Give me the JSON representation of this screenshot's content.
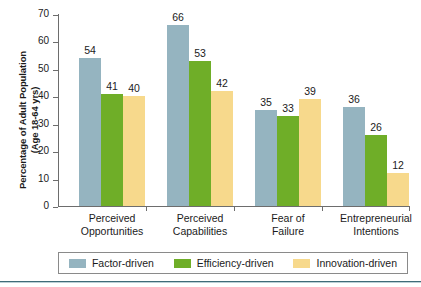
{
  "chart_data": {
    "type": "bar",
    "title": "",
    "subtitle": "",
    "xlabel": "",
    "ylabel": "Percentage of Adult Population (Age 18-64 yrs)",
    "ylabel_line1": "Percentage of Adult Population",
    "ylabel_line2": "(Age 18-64 yrs)",
    "ylim": [
      0,
      70
    ],
    "ytick_step": 10,
    "yticks": [
      0,
      10,
      20,
      30,
      40,
      50,
      60,
      70
    ],
    "ytick_labels": [
      "0",
      "10",
      "20",
      "30",
      "40",
      "50",
      "60",
      "70"
    ],
    "grid": false,
    "legend_position": "bottom",
    "categories": [
      "Perceived Opportunities",
      "Perceived Capabilities",
      "Fear of Failure",
      "Entrepreneurial Intentions"
    ],
    "category_lines": [
      [
        "Perceived",
        "Opportunities"
      ],
      [
        "Perceived",
        "Capabilities"
      ],
      [
        "Fear of",
        "Failure"
      ],
      [
        "Entrepreneurial",
        "Intentions"
      ]
    ],
    "series": [
      {
        "name": "Factor-driven",
        "color": "#95b4c0",
        "values": [
          54,
          66,
          35,
          36
        ],
        "labels": [
          "54",
          "66",
          "35",
          "36"
        ]
      },
      {
        "name": "Efficiency-driven",
        "color": "#6fae28",
        "values": [
          41,
          53,
          33,
          26
        ],
        "labels": [
          "41",
          "53",
          "33",
          "26"
        ]
      },
      {
        "name": "Innovation-driven",
        "color": "#f7d98c",
        "values": [
          40,
          42,
          39,
          12
        ],
        "labels": [
          "40",
          "42",
          "39",
          "12"
        ]
      }
    ]
  },
  "legend": {
    "items": [
      {
        "label": "Factor-driven",
        "color": "#95b4c0"
      },
      {
        "label": "Efficiency-driven",
        "color": "#6fae28"
      },
      {
        "label": "Innovation-driven",
        "color": "#f7d98c"
      }
    ]
  },
  "colors": {
    "factor_driven": "#95b4c0",
    "efficiency_driven": "#6fae28",
    "innovation_driven": "#f7d98c",
    "axis": "#6d6d6d",
    "text": "#1b1b1b",
    "background": "#ffffff",
    "bottom_rule": "#3f6b78"
  }
}
